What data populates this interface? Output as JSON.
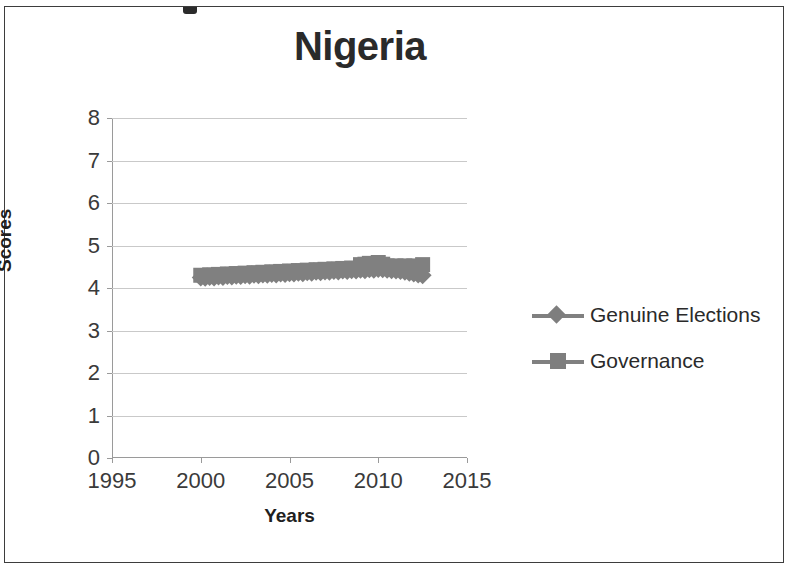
{
  "chart_data": {
    "type": "line",
    "title": "Nigeria",
    "xlabel": "Years",
    "ylabel": "Scores",
    "xlim": [
      1995,
      2015
    ],
    "ylim": [
      0,
      8
    ],
    "xticks": [
      1995,
      2000,
      2005,
      2010,
      2015
    ],
    "yticks": [
      0,
      1,
      2,
      3,
      4,
      5,
      6,
      7,
      8
    ],
    "grid": true,
    "legend_position": "right",
    "marker_color": "#808080",
    "series": [
      {
        "name": "Genuine Elections",
        "marker": "diamond",
        "color": "#808080",
        "x": [
          2000,
          2000.25,
          2000.5,
          2000.75,
          2001,
          2001.25,
          2001.5,
          2001.75,
          2002,
          2002.25,
          2002.5,
          2002.75,
          2003,
          2003.25,
          2003.5,
          2003.75,
          2004,
          2004.25,
          2004.5,
          2004.75,
          2005,
          2005.25,
          2005.5,
          2005.75,
          2006,
          2006.25,
          2006.5,
          2006.75,
          2007,
          2007.25,
          2007.5,
          2007.75,
          2008,
          2008.25,
          2008.5,
          2008.75,
          2009,
          2009.25,
          2009.5,
          2009.75,
          2010,
          2010.25,
          2010.5,
          2010.75,
          2011,
          2011.25,
          2011.5,
          2011.75,
          2012,
          2012.25,
          2012.5
        ],
        "y": [
          4.25,
          4.24,
          4.26,
          4.25,
          4.27,
          4.26,
          4.28,
          4.27,
          4.29,
          4.28,
          4.3,
          4.29,
          4.31,
          4.3,
          4.32,
          4.31,
          4.33,
          4.32,
          4.34,
          4.33,
          4.35,
          4.34,
          4.36,
          4.35,
          4.37,
          4.36,
          4.38,
          4.37,
          4.39,
          4.38,
          4.4,
          4.39,
          4.41,
          4.4,
          4.42,
          4.41,
          4.43,
          4.42,
          4.44,
          4.43,
          4.45,
          4.44,
          4.43,
          4.42,
          4.41,
          4.4,
          4.38,
          4.36,
          4.34,
          4.32,
          4.3
        ]
      },
      {
        "name": "Governance",
        "marker": "square",
        "color": "#808080",
        "x": [
          2000,
          2000.25,
          2000.5,
          2000.75,
          2001,
          2001.25,
          2001.5,
          2001.75,
          2002,
          2002.25,
          2002.5,
          2002.75,
          2003,
          2003.25,
          2003.5,
          2003.75,
          2004,
          2004.25,
          2004.5,
          2004.75,
          2005,
          2005.25,
          2005.5,
          2005.75,
          2006,
          2006.25,
          2006.5,
          2006.75,
          2007,
          2007.25,
          2007.5,
          2007.75,
          2008,
          2008.25,
          2008.5,
          2008.75,
          2009,
          2009.25,
          2009.5,
          2009.75,
          2010,
          2010.25,
          2010.5,
          2010.75,
          2011,
          2011.25,
          2011.5,
          2011.75,
          2012,
          2012.25,
          2012.5
        ],
        "y": [
          4.3,
          4.29,
          4.31,
          4.3,
          4.32,
          4.31,
          4.33,
          4.32,
          4.34,
          4.33,
          4.35,
          4.34,
          4.36,
          4.35,
          4.37,
          4.36,
          4.38,
          4.37,
          4.39,
          4.38,
          4.4,
          4.39,
          4.41,
          4.4,
          4.42,
          4.41,
          4.43,
          4.42,
          4.44,
          4.43,
          4.45,
          4.44,
          4.46,
          4.45,
          4.47,
          4.46,
          4.55,
          4.56,
          4.58,
          4.57,
          4.6,
          4.56,
          4.52,
          4.5,
          4.52,
          4.5,
          4.52,
          4.5,
          4.52,
          4.5,
          4.55
        ]
      }
    ]
  },
  "legend": {
    "items": [
      {
        "label": "Genuine Elections",
        "marker": "diamond"
      },
      {
        "label": "Governance",
        "marker": "square"
      }
    ]
  }
}
